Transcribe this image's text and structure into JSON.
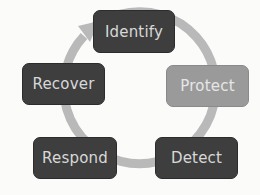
{
  "diagram": {
    "type": "cycle",
    "nodes": [
      {
        "id": "identify",
        "label": "Identify",
        "style": "dark"
      },
      {
        "id": "protect",
        "label": "Protect",
        "style": "light"
      },
      {
        "id": "detect",
        "label": "Detect",
        "style": "dark"
      },
      {
        "id": "respond",
        "label": "Respond",
        "style": "dark"
      },
      {
        "id": "recover",
        "label": "Recover",
        "style": "dark"
      }
    ],
    "flow": "clockwise",
    "colors": {
      "dark_node": "#3e3e3e",
      "highlight_node": "#9a9a9a",
      "ring": "#b8b8b8",
      "text": "#d8d8d8"
    }
  }
}
